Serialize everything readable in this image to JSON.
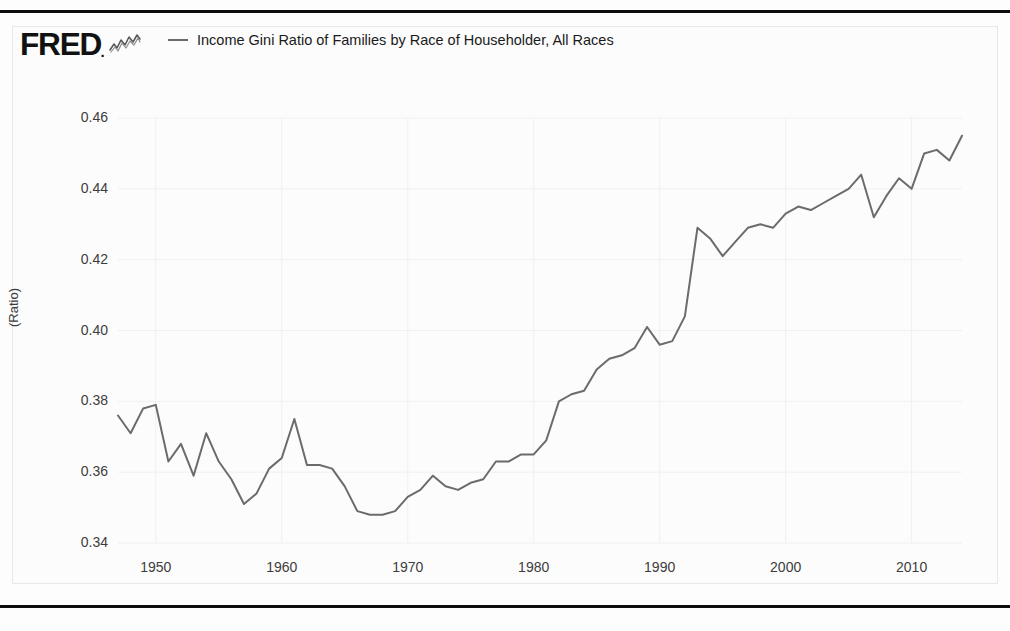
{
  "branding": {
    "logo_text": "FRED",
    "logo_dot": ".",
    "logo_mark": "squiggle-chart-icon"
  },
  "legend": {
    "series_label": "Income Gini Ratio of Families by Race of Householder, All Races",
    "line_color": "#6b6b6b"
  },
  "axis": {
    "y_title": "(Ratio)",
    "y_ticks": [
      "0.46",
      "0.44",
      "0.42",
      "0.40",
      "0.38",
      "0.36",
      "0.34"
    ],
    "x_ticks": [
      "1950",
      "1960",
      "1970",
      "1980",
      "1990",
      "2000",
      "2010"
    ]
  },
  "chart_data": {
    "type": "line",
    "title": "Income Gini Ratio of Families by Race of Householder, All Races",
    "xlabel": "",
    "ylabel": "(Ratio)",
    "xlim": [
      1947,
      2014
    ],
    "ylim": [
      0.34,
      0.46
    ],
    "grid": true,
    "legend_position": "top",
    "x_tick_values": [
      1950,
      1960,
      1970,
      1980,
      1990,
      2000,
      2010
    ],
    "y_tick_values": [
      0.34,
      0.36,
      0.38,
      0.4,
      0.42,
      0.44,
      0.46
    ],
    "series": [
      {
        "name": "Income Gini Ratio of Families by Race of Householder, All Races",
        "color": "#6b6b6b",
        "x": [
          1947,
          1948,
          1949,
          1950,
          1951,
          1952,
          1953,
          1954,
          1955,
          1956,
          1957,
          1958,
          1959,
          1960,
          1961,
          1962,
          1963,
          1964,
          1965,
          1966,
          1967,
          1968,
          1969,
          1970,
          1971,
          1972,
          1973,
          1974,
          1975,
          1976,
          1977,
          1978,
          1979,
          1980,
          1981,
          1982,
          1983,
          1984,
          1985,
          1986,
          1987,
          1988,
          1989,
          1990,
          1991,
          1992,
          1993,
          1994,
          1995,
          1996,
          1997,
          1998,
          1999,
          2000,
          2001,
          2002,
          2003,
          2004,
          2005,
          2006,
          2007,
          2008,
          2009,
          2010,
          2011,
          2012,
          2013,
          2014
        ],
        "y": [
          0.376,
          0.371,
          0.378,
          0.379,
          0.363,
          0.368,
          0.359,
          0.371,
          0.363,
          0.358,
          0.351,
          0.354,
          0.361,
          0.364,
          0.375,
          0.362,
          0.362,
          0.361,
          0.356,
          0.349,
          0.348,
          0.348,
          0.349,
          0.353,
          0.355,
          0.359,
          0.356,
          0.355,
          0.357,
          0.358,
          0.363,
          0.363,
          0.365,
          0.365,
          0.369,
          0.38,
          0.382,
          0.383,
          0.389,
          0.392,
          0.393,
          0.395,
          0.401,
          0.396,
          0.397,
          0.404,
          0.429,
          0.426,
          0.421,
          0.425,
          0.429,
          0.43,
          0.429,
          0.433,
          0.435,
          0.434,
          0.436,
          0.438,
          0.44,
          0.444,
          0.432,
          0.438,
          0.443,
          0.44,
          0.45,
          0.451,
          0.448,
          0.455
        ]
      }
    ]
  }
}
